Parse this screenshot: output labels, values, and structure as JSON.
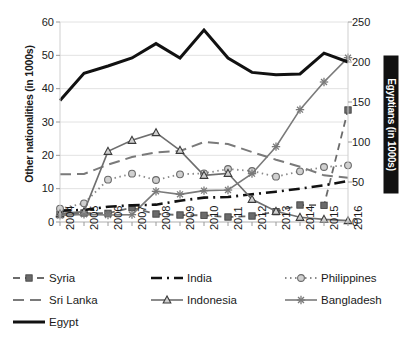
{
  "chart_data": {
    "type": "line",
    "title": "",
    "xlabel": "",
    "ylabel": "Other nationalities (in 1000s)",
    "ylabel_secondary": "Egyptians (in 1000s)",
    "categories": [
      "2004",
      "2005",
      "2006",
      "2007",
      "2008",
      "2009",
      "2010",
      "2011",
      "2012",
      "2013",
      "2014",
      "2015",
      "2016"
    ],
    "ylim": [
      0,
      60
    ],
    "yticks": [
      "0",
      "10",
      "20",
      "30",
      "40",
      "50",
      "60"
    ],
    "ylim_secondary": [
      0,
      250
    ],
    "yticks_secondary": [
      "0",
      "50",
      "100",
      "150",
      "200",
      "250"
    ],
    "grid": true,
    "legend_position": "bottom",
    "series": [
      {
        "name": "Syria",
        "axis": "left",
        "marker": "square",
        "style": "dashed",
        "color": "#6b6b6b",
        "values": [
          2.2,
          2.7,
          2.6,
          4.3,
          2.4,
          2.1,
          2.0,
          1.5,
          1.8,
          3.1,
          5.1,
          5.0,
          33.6
        ]
      },
      {
        "name": "India",
        "axis": "left",
        "marker": "none",
        "style": "dash-dot-thick",
        "color": "#111111",
        "values": [
          3.4,
          3.6,
          4.6,
          5.0,
          5.2,
          6.4,
          7.3,
          7.5,
          8.3,
          9.1,
          10.0,
          11.0,
          12.3
        ]
      },
      {
        "name": "Philippines",
        "axis": "left",
        "marker": "circle",
        "style": "dotted",
        "color": "#8a8a8a",
        "values": [
          4.0,
          5.6,
          12.7,
          14.5,
          12.6,
          14.3,
          14.6,
          15.9,
          15.3,
          13.6,
          15.2,
          16.5,
          17.0
        ]
      },
      {
        "name": "Sri Lanka",
        "axis": "left",
        "marker": "none",
        "style": "long-dash",
        "color": "#7a7a7a",
        "values": [
          14.3,
          14.4,
          17.2,
          19.5,
          20.9,
          21.3,
          24.0,
          23.4,
          21.0,
          18.7,
          16.6,
          14.0,
          13.3
        ]
      },
      {
        "name": "Indonesia",
        "axis": "left",
        "marker": "triangle",
        "style": "solid",
        "color": "#6e6e6e",
        "values": [
          2.5,
          3.1,
          21.2,
          24.5,
          26.8,
          21.5,
          14.0,
          14.6,
          6.8,
          3.2,
          1.4,
          0.8,
          0.4
        ]
      },
      {
        "name": "Bangladesh",
        "axis": "left",
        "marker": "star",
        "style": "solid",
        "color": "#7a7a7a",
        "values": [
          2.0,
          2.3,
          2.1,
          2.2,
          9.2,
          8.3,
          9.4,
          9.6,
          14.5,
          22.6,
          33.7,
          42.0,
          49.3
        ]
      },
      {
        "name": "Egypt",
        "axis": "right",
        "marker": "none",
        "style": "solid-thick",
        "color": "#111111",
        "values": [
          152,
          186,
          195,
          205,
          223,
          205,
          240,
          205,
          187,
          184,
          185,
          211,
          200
        ]
      }
    ]
  },
  "legend": {
    "items": [
      {
        "label": "Syria"
      },
      {
        "label": "India"
      },
      {
        "label": "Philippines"
      },
      {
        "label": "Sri Lanka"
      },
      {
        "label": "Indonesia"
      },
      {
        "label": "Bangladesh"
      },
      {
        "label": "Egypt"
      }
    ]
  }
}
